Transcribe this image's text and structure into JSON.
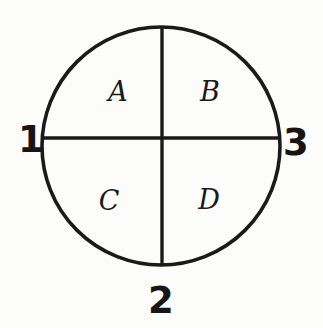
{
  "figure": {
    "type": "quadrant-circle-diagram",
    "background_color": "#fcfcfa",
    "stroke_color": "#1a1a1a",
    "title": ""
  },
  "circle": {
    "center_x": 161,
    "center_y": 146,
    "radius": 119,
    "stroke_width": 3.6
  },
  "dividers": {
    "vertical": {
      "x": 162,
      "y_top": 27,
      "y_bottom": 265,
      "stroke_width": 3.4
    },
    "horizontal": {
      "y": 138,
      "x_left": 43,
      "x_right": 280,
      "stroke_width": 3.4
    }
  },
  "quadrants": [
    {
      "id": "top-left",
      "label": "A",
      "x": 118,
      "y": 101
    },
    {
      "id": "top-right",
      "label": "B",
      "x": 210,
      "y": 101
    },
    {
      "id": "bottom-left",
      "label": "C",
      "x": 109,
      "y": 210
    },
    {
      "id": "bottom-right",
      "label": "D",
      "x": 209,
      "y": 209
    }
  ],
  "markers": [
    {
      "id": "left",
      "label": "1",
      "x": 18,
      "y": 152
    },
    {
      "id": "right",
      "label": "3",
      "x": 283,
      "y": 155
    },
    {
      "id": "bottom",
      "label": "2",
      "x": 148,
      "y": 313
    }
  ]
}
